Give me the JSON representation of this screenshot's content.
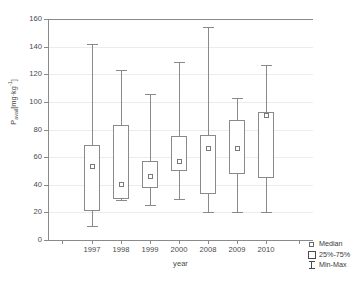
{
  "chart_data": {
    "type": "box",
    "title": "",
    "xlabel": "year",
    "ylabel": "P avail [mg·kg-1]",
    "ylabel_parts": {
      "main": "P",
      "sub": "avail",
      "unit": "[mg·kg",
      "sup": "-1",
      "unit_end": "]"
    },
    "categories": [
      "1997",
      "1998",
      "1999",
      "2000",
      "2008",
      "2009",
      "2010"
    ],
    "ylim": [
      0,
      160
    ],
    "yticks": [
      0,
      20,
      40,
      60,
      80,
      100,
      120,
      140,
      160
    ],
    "ytick_labels": [
      "0",
      "20",
      "40",
      "60",
      "80",
      "100",
      "120",
      "140",
      "160"
    ],
    "grid": "horizontal-faint",
    "legend_position": "bottom-right-outside",
    "boxes": [
      {
        "category": "1997",
        "min": 10,
        "q1": 21,
        "median": 53,
        "q3": 69,
        "max": 142
      },
      {
        "category": "1998",
        "min": 29,
        "q1": 30,
        "median": 40,
        "q3": 83,
        "max": 123
      },
      {
        "category": "1999",
        "min": 25,
        "q1": 38,
        "median": 46,
        "q3": 57,
        "max": 106
      },
      {
        "category": "2000",
        "min": 30,
        "q1": 50,
        "median": 57,
        "q3": 75,
        "max": 129
      },
      {
        "category": "2008",
        "min": 20,
        "q1": 33,
        "median": 66,
        "q3": 76,
        "max": 154
      },
      {
        "category": "2009",
        "min": 20,
        "q1": 48,
        "median": 66,
        "q3": 87,
        "max": 103
      },
      {
        "category": "2010",
        "min": 20,
        "q1": 45,
        "median": 90,
        "q3": 93,
        "max": 127
      }
    ],
    "legend": [
      {
        "label": "Median",
        "symbol": "small-open-square"
      },
      {
        "label": "25%-75%",
        "symbol": "open-rectangle"
      },
      {
        "label": "Min-Max",
        "symbol": "i-beam-whisker"
      }
    ]
  },
  "colors": {
    "axis": "#8a8a8a",
    "grid": "#ececec",
    "text": "#3a3a3a",
    "box_stroke": "#8a8a8a",
    "background": "#ffffff"
  }
}
